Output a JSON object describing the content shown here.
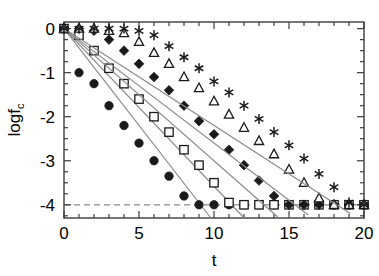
{
  "chart_data": {
    "type": "scatter",
    "title": "",
    "subtitle": "",
    "xlabel": "t",
    "ylabel": "logf_c",
    "ylabel_base": "logf",
    "ylabel_sub": "c",
    "xlim": [
      0,
      20
    ],
    "ylim": [
      -4.3,
      0.15
    ],
    "xticks": [
      0,
      5,
      10,
      15,
      20
    ],
    "xticklabels": [
      "0",
      "5",
      "10",
      "15",
      "20"
    ],
    "xminor_step": 1,
    "yticks": [
      0,
      -1,
      -2,
      -3,
      -4
    ],
    "yticklabels": [
      "0",
      "-1",
      "-2",
      "-3",
      "-4"
    ],
    "yminor_step": 0.25,
    "grid": false,
    "legend": "none",
    "line_color": "#8a8a8a",
    "marker_color": "#1a1a1a",
    "axis_color": "#3c3c3c",
    "annotations": [
      {
        "type": "hline",
        "y": -4,
        "style": "dashed",
        "label": "saturation floor",
        "color": "#8a8a8a"
      }
    ],
    "saturation_level": -4,
    "series": [
      {
        "name": "filled-circles",
        "marker": "filled-circle",
        "slope": -0.45,
        "x": [
          0,
          1,
          2,
          3,
          4,
          5,
          6,
          7,
          8,
          9,
          10,
          11,
          12,
          13,
          14,
          15,
          16,
          17,
          18,
          19,
          20
        ],
        "y": [
          0,
          -1.0,
          -1.25,
          -1.75,
          -2.2,
          -2.6,
          -3.0,
          -3.35,
          -3.8,
          -4.0,
          -4.0,
          -4.0,
          -4.0,
          -4.0,
          -4.0,
          -4.0,
          -4.0,
          -4.0,
          -4.0,
          -4.0,
          -4.0
        ]
      },
      {
        "name": "open-squares",
        "marker": "open-square",
        "slope": -0.36,
        "x": [
          0,
          1,
          2,
          3,
          4,
          5,
          6,
          7,
          8,
          9,
          10,
          11,
          12,
          13,
          14,
          15,
          16,
          17,
          18,
          19,
          20
        ],
        "y": [
          0,
          -0.15,
          -0.5,
          -0.9,
          -1.25,
          -1.6,
          -2.0,
          -2.35,
          -2.75,
          -3.1,
          -3.5,
          -3.95,
          -4.0,
          -4.0,
          -4.0,
          -4.0,
          -4.0,
          -4.0,
          -4.0,
          -4.0,
          -4.0
        ]
      },
      {
        "name": "filled-diamonds",
        "marker": "filled-diamond",
        "slope": -0.3,
        "x": [
          0,
          1,
          2,
          3,
          4,
          5,
          6,
          7,
          8,
          9,
          10,
          11,
          12,
          13,
          14,
          15,
          16,
          17,
          18,
          19,
          20
        ],
        "y": [
          0,
          0,
          -0.05,
          -0.25,
          -0.5,
          -0.8,
          -1.1,
          -1.4,
          -1.75,
          -2.1,
          -2.4,
          -2.75,
          -3.1,
          -3.45,
          -3.8,
          -4.0,
          -4.0,
          -4.0,
          -4.0,
          -4.0,
          -4.0
        ]
      },
      {
        "name": "open-triangles",
        "marker": "open-triangle",
        "slope": -0.26,
        "x": [
          0,
          1,
          2,
          3,
          4,
          5,
          6,
          7,
          8,
          9,
          10,
          11,
          12,
          13,
          14,
          15,
          16,
          17,
          18,
          19,
          20
        ],
        "y": [
          0,
          0,
          0,
          -0.05,
          -0.1,
          -0.3,
          -0.55,
          -0.8,
          -1.1,
          -1.35,
          -1.65,
          -1.95,
          -2.25,
          -2.55,
          -2.85,
          -3.2,
          -3.5,
          -3.85,
          -4.0,
          -4.0,
          -4.0
        ]
      },
      {
        "name": "asterisks",
        "marker": "asterisk",
        "slope": -0.22,
        "x": [
          0,
          1,
          2,
          3,
          4,
          5,
          6,
          7,
          8,
          9,
          10,
          11,
          12,
          13,
          14,
          15,
          16,
          17,
          18,
          19,
          20
        ],
        "y": [
          0,
          0,
          0,
          0,
          0,
          -0.05,
          -0.15,
          -0.4,
          -0.65,
          -0.9,
          -1.2,
          -1.45,
          -1.75,
          -2.05,
          -2.35,
          -2.65,
          -2.95,
          -3.3,
          -3.6,
          -3.95,
          -4.0
        ]
      }
    ]
  }
}
